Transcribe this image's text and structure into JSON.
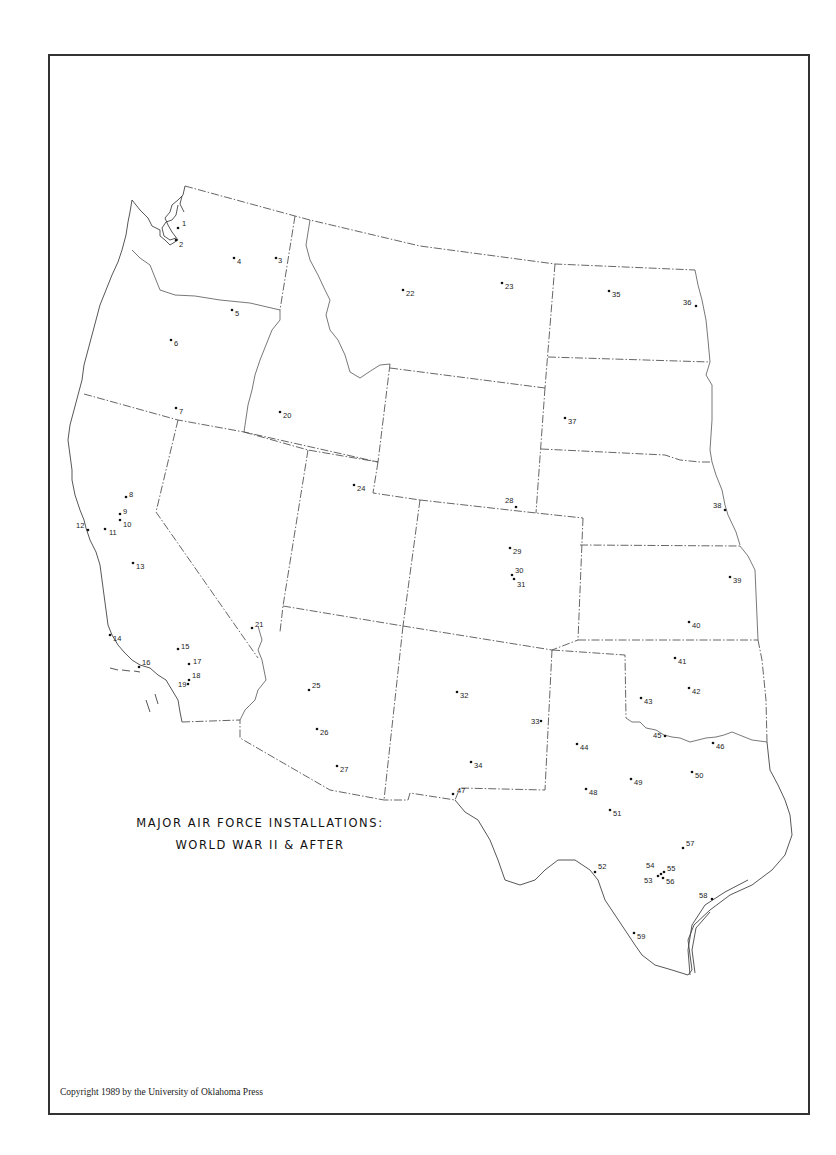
{
  "map": {
    "title_line1": "MAJOR AIR FORCE INSTALLATIONS:",
    "title_line2": "WORLD WAR II & AFTER",
    "copyright": "Copyright 1989 by the University of Oklahoma Press",
    "region": "Western United States",
    "marker_color": "#111111",
    "border_style": "dash-dot state boundaries",
    "installations": [
      "1",
      "2",
      "3",
      "4",
      "5",
      "6",
      "7",
      "8",
      "9",
      "10",
      "11",
      "12",
      "13",
      "14",
      "15",
      "16",
      "17",
      "18",
      "19",
      "20",
      "21",
      "22",
      "23",
      "24",
      "25",
      "26",
      "27",
      "28",
      "29",
      "30",
      "31",
      "32",
      "33",
      "34",
      "35",
      "36",
      "37",
      "38",
      "39",
      "40",
      "41",
      "42",
      "43",
      "44",
      "45",
      "46",
      "47",
      "48",
      "49",
      "50",
      "51",
      "52",
      "53",
      "54",
      "55",
      "56",
      "57",
      "58",
      "59"
    ]
  }
}
